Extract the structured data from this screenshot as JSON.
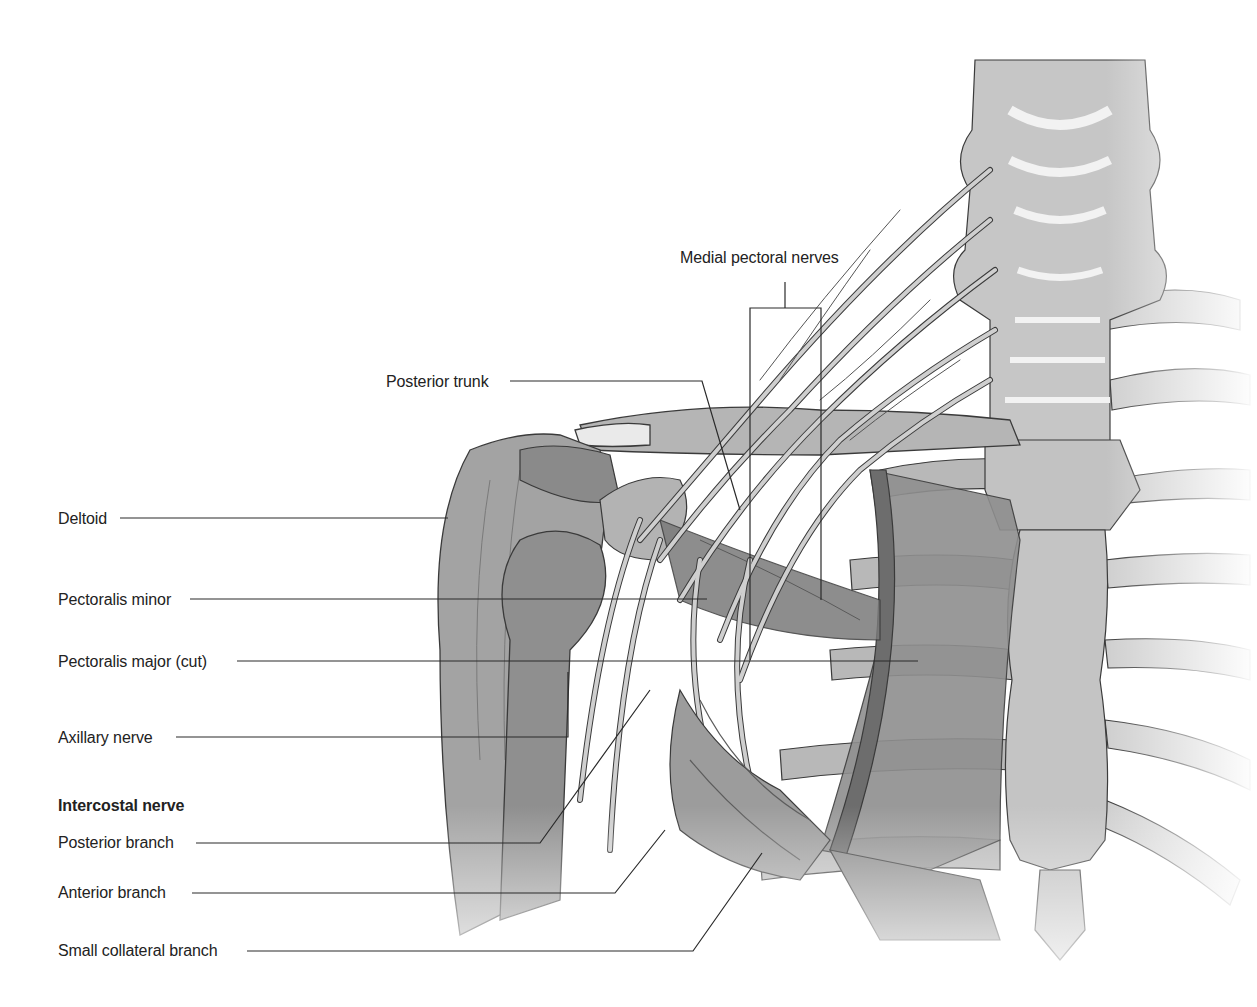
{
  "figure": {
    "colors": {
      "background": "#ffffff",
      "text": "#222222",
      "leader_line": "#2a2a2a",
      "muscle": "#8c8c8c",
      "muscle_dark": "#6f6f6f",
      "bone": "#bdbdbd",
      "bone_light": "#dcdcdc",
      "nerve": "#c8c8c8",
      "outline": "#3a3a3a"
    }
  },
  "labels": {
    "medial_pectoral_nerves": "Medial pectoral nerves",
    "posterior_trunk": "Posterior trunk",
    "deltoid": "Deltoid",
    "pectoralis_minor": "Pectoralis minor",
    "pectoralis_major_cut": "Pectoralis major (cut)",
    "axillary_nerve": "Axillary nerve",
    "intercostal_nerve_heading": "Intercostal nerve",
    "posterior_branch": "Posterior branch",
    "anterior_branch": "Anterior branch",
    "small_collateral_branch": "Small collateral branch"
  }
}
